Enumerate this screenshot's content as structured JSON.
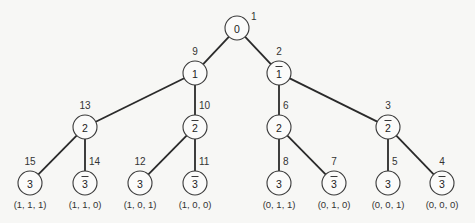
{
  "diagram": {
    "type": "binary-tree",
    "node_radius": 12,
    "nodes": [
      {
        "id": "n0",
        "label": "0",
        "bar": false,
        "order": "1",
        "x": 237,
        "y": 28,
        "order_pos": "right"
      },
      {
        "id": "n1",
        "label": "1",
        "bar": false,
        "order": "9",
        "x": 195,
        "y": 73,
        "order_pos": "top"
      },
      {
        "id": "n1b",
        "label": "1",
        "bar": true,
        "order": "2",
        "x": 279,
        "y": 73,
        "order_pos": "top"
      },
      {
        "id": "n2a",
        "label": "2",
        "bar": false,
        "order": "13",
        "x": 85,
        "y": 127,
        "order_pos": "top"
      },
      {
        "id": "n2ab",
        "label": "2",
        "bar": true,
        "order": "10",
        "x": 195,
        "y": 127,
        "order_pos": "topright"
      },
      {
        "id": "n2c",
        "label": "2",
        "bar": false,
        "order": "6",
        "x": 279,
        "y": 127,
        "order_pos": "topright"
      },
      {
        "id": "n2cb",
        "label": "2",
        "bar": true,
        "order": "3",
        "x": 388,
        "y": 127,
        "order_pos": "top"
      },
      {
        "id": "l1",
        "label": "3",
        "bar": false,
        "order": "15",
        "x": 30,
        "y": 183,
        "order_pos": "top",
        "tuple": "(1, 1, 1)"
      },
      {
        "id": "l2",
        "label": "3",
        "bar": true,
        "order": "14",
        "x": 85,
        "y": 183,
        "order_pos": "topright",
        "tuple": "(1, 1, 0)"
      },
      {
        "id": "l3",
        "label": "3",
        "bar": false,
        "order": "12",
        "x": 140,
        "y": 183,
        "order_pos": "top",
        "tuple": "(1, 0, 1)"
      },
      {
        "id": "l4",
        "label": "3",
        "bar": true,
        "order": "11",
        "x": 195,
        "y": 183,
        "order_pos": "topright",
        "tuple": "(1, 0, 0)"
      },
      {
        "id": "l5",
        "label": "3",
        "bar": false,
        "order": "8",
        "x": 279,
        "y": 183,
        "order_pos": "topright",
        "tuple": "(0, 1, 1)"
      },
      {
        "id": "l6",
        "label": "3",
        "bar": true,
        "order": "7",
        "x": 334,
        "y": 183,
        "order_pos": "top",
        "tuple": "(0, 1, 0)"
      },
      {
        "id": "l7",
        "label": "3",
        "bar": false,
        "order": "5",
        "x": 388,
        "y": 183,
        "order_pos": "topright",
        "tuple": "(0, 0, 1)"
      },
      {
        "id": "l8",
        "label": "3",
        "bar": true,
        "order": "4",
        "x": 442,
        "y": 183,
        "order_pos": "top",
        "tuple": "(0, 0, 0)"
      }
    ],
    "edges": [
      [
        "n0",
        "n1"
      ],
      [
        "n0",
        "n1b"
      ],
      [
        "n1",
        "n2a"
      ],
      [
        "n1",
        "n2ab"
      ],
      [
        "n1b",
        "n2c"
      ],
      [
        "n1b",
        "n2cb"
      ],
      [
        "n2a",
        "l1"
      ],
      [
        "n2a",
        "l2"
      ],
      [
        "n2ab",
        "l3"
      ],
      [
        "n2ab",
        "l4"
      ],
      [
        "n2c",
        "l5"
      ],
      [
        "n2c",
        "l6"
      ],
      [
        "n2cb",
        "l7"
      ],
      [
        "n2cb",
        "l8"
      ]
    ]
  }
}
